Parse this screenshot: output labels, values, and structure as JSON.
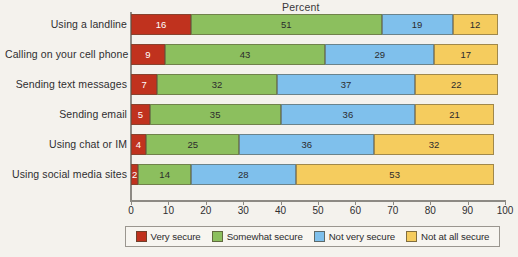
{
  "chart_data": {
    "type": "bar",
    "orientation": "horizontal",
    "stacked": true,
    "title": "Percent",
    "xlabel": "",
    "ylabel": "",
    "xlim": [
      0,
      100
    ],
    "xticks": [
      0,
      10,
      20,
      30,
      40,
      50,
      60,
      70,
      80,
      90,
      100
    ],
    "grid": false,
    "legend_position": "bottom",
    "categories": [
      "Using a landline",
      "Calling on your cell phone",
      "Sending text messages",
      "Sending email",
      "Using chat or IM",
      "Using social media sites"
    ],
    "series": [
      {
        "name": "Very secure",
        "color": "#C0321E",
        "values": [
          16,
          9,
          7,
          5,
          4,
          2
        ]
      },
      {
        "name": "Somewhat secure",
        "color": "#8CBF5E",
        "values": [
          51,
          43,
          32,
          35,
          25,
          14
        ]
      },
      {
        "name": "Not very secure",
        "color": "#7FC0EC",
        "values": [
          19,
          29,
          37,
          36,
          36,
          28
        ]
      },
      {
        "name": "Not at all secure",
        "color": "#F5CC5E",
        "values": [
          12,
          17,
          22,
          21,
          32,
          53
        ]
      }
    ]
  }
}
